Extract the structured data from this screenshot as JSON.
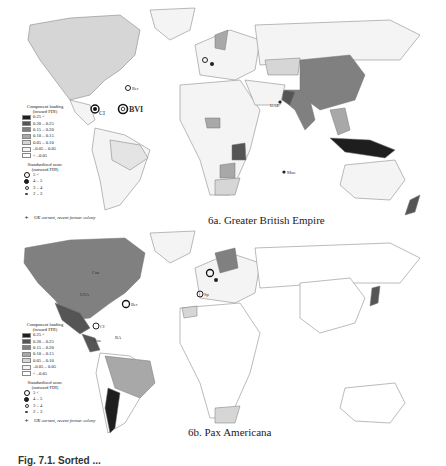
{
  "panels": [
    {
      "id": "6a",
      "title": "6a. Greater British Empire",
      "legend": {
        "loading_title": "Component loading (inward FDI)",
        "loading_classes": [
          {
            "label": "0.25 <",
            "color": "#1e1e1e"
          },
          {
            "label": "0.20 – 0.25",
            "color": "#555555"
          },
          {
            "label": "0.15 – 0.20",
            "color": "#808080"
          },
          {
            "label": "0.10 – 0.15",
            "color": "#a8a8a8"
          },
          {
            "label": "0.05 – 0.10",
            "color": "#d6d6d6"
          },
          {
            "label": "–0.05 – 0.05",
            "color": "#f4f4f4"
          },
          {
            "label": "< –0.05",
            "color": "#ffffff"
          }
        ],
        "score_title": "Standardized score (outward FDI)",
        "score_classes": [
          {
            "label": "5 <",
            "marker": "large-ring"
          },
          {
            "label": "4 – 5",
            "marker": "filled-ring"
          },
          {
            "label": "3 – 4",
            "marker": "small-ring"
          },
          {
            "label": "2 – 3",
            "marker": "star"
          }
        ],
        "note": "UK current, recent former colony"
      },
      "map_labels": [
        "CI",
        "BVI",
        "Ber",
        "UAE",
        "Mau"
      ]
    },
    {
      "id": "6b",
      "title": "6b. Pax Americana",
      "legend": {
        "loading_title": "Component loading (inward FDI)",
        "loading_classes": [
          {
            "label": "0.25 <",
            "color": "#1e1e1e"
          },
          {
            "label": "0.20 – 0.25",
            "color": "#555555"
          },
          {
            "label": "0.15 – 0.20",
            "color": "#808080"
          },
          {
            "label": "0.10 – 0.15",
            "color": "#a8a8a8"
          },
          {
            "label": "0.05 – 0.10",
            "color": "#d6d6d6"
          },
          {
            "label": "–0.05 – 0.05",
            "color": "#f4f4f4"
          },
          {
            "label": "< –0.05",
            "color": "#ffffff"
          }
        ],
        "score_title": "Standardized score (outward FDI)",
        "score_classes": [
          {
            "label": "5 <",
            "marker": "large-ring"
          },
          {
            "label": "4 – 5",
            "marker": "filled-ring"
          },
          {
            "label": "3 – 4",
            "marker": "small-ring"
          },
          {
            "label": "2 – 3",
            "marker": "star"
          }
        ],
        "note": "UK current, recent former colony"
      },
      "map_labels": [
        "Can",
        "USA",
        "Ber",
        "CI",
        "Pan",
        "BA",
        "Sp"
      ]
    }
  ],
  "caption": "Fig. 7.1. Sorted ..."
}
